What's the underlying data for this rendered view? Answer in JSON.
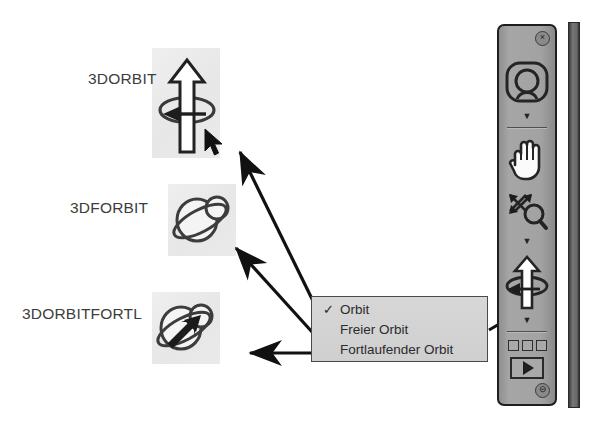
{
  "page": {
    "width": 595,
    "height": 428,
    "background": "#ffffff"
  },
  "commands": [
    {
      "id": "3dorbit",
      "label": "3DORBIT",
      "icon": "constrained-orbit-icon",
      "label_pos": {
        "x": 88,
        "y": 71
      },
      "plate": {
        "x": 152,
        "y": 48,
        "w": 68,
        "h": 110
      }
    },
    {
      "id": "3dforbit",
      "label": "3DFORBIT",
      "icon": "free-orbit-icon",
      "label_pos": {
        "x": 70,
        "y": 200
      },
      "plate": {
        "x": 168,
        "y": 184,
        "w": 68,
        "h": 72
      }
    },
    {
      "id": "3dorbitfortl",
      "label": "3DORBITFORTL",
      "icon": "continuous-orbit-icon",
      "label_pos": {
        "x": 22,
        "y": 306
      },
      "plate": {
        "x": 152,
        "y": 292,
        "w": 68,
        "h": 72
      }
    }
  ],
  "context_menu": {
    "name": "orbit-context-menu",
    "items": [
      {
        "label": "Orbit",
        "checked": true,
        "check_glyph": "✓"
      },
      {
        "label": "Freier Orbit",
        "checked": false,
        "check_glyph": ""
      },
      {
        "label": "Fortlaufender Orbit",
        "checked": false,
        "check_glyph": ""
      }
    ],
    "background": "#d2d2d2",
    "border_color": "#4a4a4a"
  },
  "toolbar": {
    "name": "3d-navigation-toolbar",
    "close_glyph": "×",
    "minimize_glyph": "⊖",
    "caret_glyph": "▼",
    "buttons": [
      {
        "id": "nav-wheel",
        "icon": "steering-wheel-icon",
        "has_caret": true
      },
      {
        "id": "pan",
        "icon": "hand-pan-icon",
        "has_caret": false
      },
      {
        "id": "zoom",
        "icon": "zoom-extents-icon",
        "has_caret": true
      },
      {
        "id": "orbit",
        "icon": "constrained-orbit-icon",
        "has_caret": true
      },
      {
        "id": "show-motion-thumbs",
        "icon": "three-squares-icon",
        "has_caret": false
      },
      {
        "id": "show-motion-play",
        "icon": "play-icon",
        "has_caret": false
      }
    ],
    "background": "#9d9d9d",
    "border_color": "#1e1e1e"
  },
  "scrollbar": {
    "name": "vertical-scrollbar",
    "color": "#6f6f6f"
  },
  "annotations": {
    "arrow_color": "#111111",
    "arrows": [
      {
        "id": "arrow-to-3dorbit",
        "from": [
          314,
          302
        ],
        "to": [
          238,
          150
        ]
      },
      {
        "id": "arrow-to-3dforbit",
        "from": [
          313,
          332
        ],
        "to": [
          235,
          246
        ]
      },
      {
        "id": "arrow-to-3dorbitfortl",
        "from": [
          313,
          353
        ],
        "to": [
          249,
          353
        ]
      },
      {
        "id": "arrow-menu-to-toolbar",
        "from": [
          489,
          330
        ],
        "to": [
          523,
          308
        ]
      },
      {
        "id": "arrow-menu-item-freier",
        "from": [
          470,
          325
        ],
        "to": [
          408,
          325
        ]
      }
    ]
  },
  "cursor": {
    "name": "mouse-cursor",
    "x": 204,
    "y": 128
  }
}
